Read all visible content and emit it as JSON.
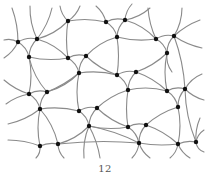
{
  "figure": {
    "type": "network-mesh-illustration",
    "caption": "12",
    "colors": {
      "edge": "#8a8a8a",
      "node": "#111111",
      "background": "#ffffff"
    }
  }
}
